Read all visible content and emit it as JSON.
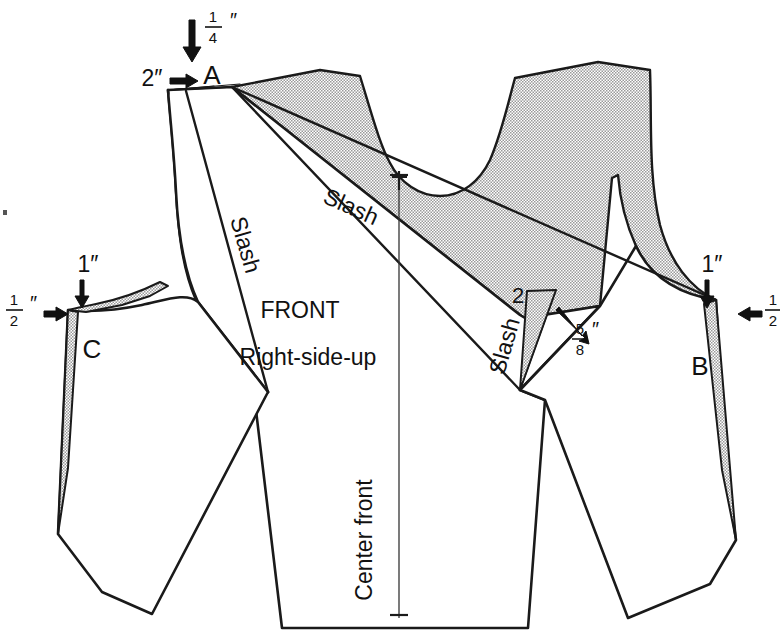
{
  "diagram": {
    "piece_labels": {
      "front": "FRONT",
      "right_side_up": "Right-side-up",
      "center_front": "Center front"
    },
    "points": {
      "a": "A",
      "b": "B",
      "c": "C",
      "two": "2"
    },
    "slash_labels": [
      {
        "id": "slash-upper-right",
        "text": "Slash"
      },
      {
        "id": "slash-left",
        "text": "Slash"
      },
      {
        "id": "slash-lower-right",
        "text": "Slash"
      }
    ],
    "measurements": [
      {
        "id": "meas-quarter-inch-top",
        "numerator": "1",
        "denominator": "4",
        "unit": "″",
        "whole": "",
        "direction": "down"
      },
      {
        "id": "meas-two-inch-shoulder",
        "whole": "2",
        "unit": "″",
        "numerator": "",
        "denominator": "",
        "direction": "right"
      },
      {
        "id": "meas-one-inch-left",
        "whole": "1",
        "unit": "″",
        "numerator": "",
        "denominator": "",
        "direction": "down"
      },
      {
        "id": "meas-half-inch-left",
        "numerator": "1",
        "denominator": "2",
        "unit": "″",
        "whole": "",
        "direction": "right"
      },
      {
        "id": "meas-one-inch-right",
        "whole": "1",
        "unit": "″",
        "numerator": "",
        "denominator": "",
        "direction": "down"
      },
      {
        "id": "meas-half-inch-right",
        "numerator": "1",
        "denominator": "2",
        "unit": "″",
        "whole": "",
        "direction": "left"
      },
      {
        "id": "meas-five-eighths-inch",
        "numerator": "5",
        "denominator": "8",
        "unit": "″",
        "whole": "",
        "direction": "upleft"
      }
    ],
    "colors": {
      "ink": "#1a1a1a",
      "paper": "#ffffff",
      "shading": "#b9b9b9"
    }
  }
}
